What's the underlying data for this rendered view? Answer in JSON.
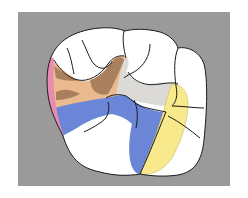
{
  "figure": {
    "type": "dental occlusal surface diagram",
    "background_color": "#9a9a9a",
    "page_color": "#ffffff",
    "tooth_fill": "#ffffff",
    "outline_color": "#1a1a1a",
    "regions": [
      {
        "name": "mesial-margin",
        "color": "#e98bb0"
      },
      {
        "name": "brown-area",
        "color": "#a8805e"
      },
      {
        "name": "tan-area",
        "color": "#eab98e"
      },
      {
        "name": "light-gray-area",
        "color": "#dcdad6"
      },
      {
        "name": "blue-area",
        "color": "#6b86d6"
      },
      {
        "name": "yellow-area",
        "color": "#f7e98c"
      }
    ]
  }
}
